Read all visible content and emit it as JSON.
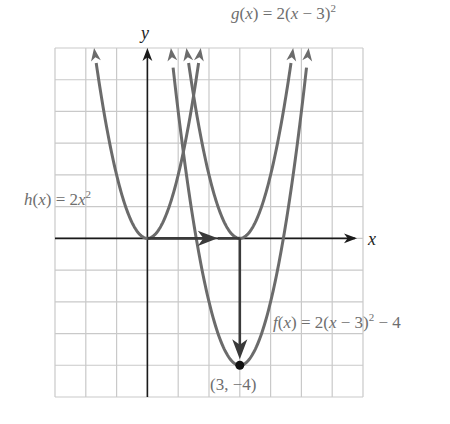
{
  "figure": {
    "x_axis_label": "x",
    "y_axis_label": "y",
    "labels": {
      "h": {
        "name": "h",
        "arg": "x",
        "rhs_prefix": " = 2",
        "rhs_var": "x",
        "power": "2",
        "rhs_suffix": ""
      },
      "g": {
        "name": "g",
        "arg": "x",
        "rhs_prefix": " = 2(",
        "rhs_var": "x",
        "rhs_mid": " − 3)",
        "power": "2",
        "rhs_suffix": ""
      },
      "f": {
        "name": "f",
        "arg": "x",
        "rhs_prefix": " = 2(",
        "rhs_var": "x",
        "rhs_mid": " − 3)",
        "power": "2",
        "rhs_suffix": " − 4"
      }
    },
    "vertex_label": "(3, −4)",
    "colors": {
      "grid": "#c9c9c9",
      "axis": "#1a1a1a",
      "curve": "#6b6b6b",
      "shift_arrow": "#3a3a3a",
      "vertex_dot": "#111111",
      "label": "#6e6e6e"
    }
  },
  "chart_data": {
    "type": "line",
    "title": "",
    "xlabel": "x",
    "ylabel": "y",
    "xlim": [
      -3,
      7
    ],
    "ylim": [
      -5,
      6
    ],
    "grid": true,
    "series": [
      {
        "name": "h(x) = 2x^2",
        "a": 2,
        "h": 0,
        "k": 0,
        "vertex": [
          0,
          0
        ]
      },
      {
        "name": "g(x) = 2(x - 3)^2",
        "a": 2,
        "h": 3,
        "k": 0,
        "vertex": [
          3,
          0
        ]
      },
      {
        "name": "f(x) = 2(x - 3)^2 - 4",
        "a": 2,
        "h": 3,
        "k": -4,
        "vertex": [
          3,
          -4
        ]
      }
    ],
    "annotations": [
      {
        "type": "arrow",
        "from": [
          0,
          0
        ],
        "to": [
          3,
          0
        ],
        "meaning": "shift right 3"
      },
      {
        "type": "arrow",
        "from": [
          3,
          0
        ],
        "to": [
          3,
          -4
        ],
        "meaning": "shift down 4"
      },
      {
        "type": "point",
        "at": [
          3,
          -4
        ],
        "label": "(3, -4)"
      }
    ]
  }
}
